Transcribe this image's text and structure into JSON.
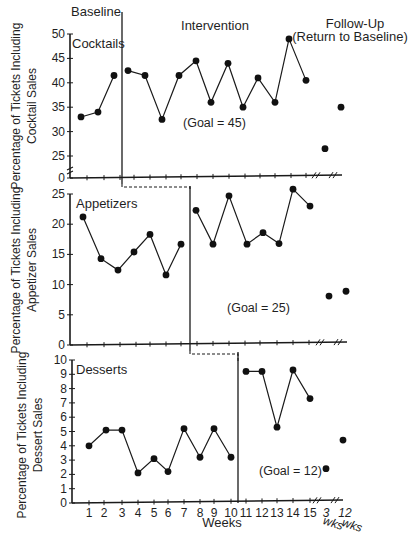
{
  "chart_data": {
    "type": "line",
    "phase_labels": {
      "baseline": "Baseline",
      "intervention": "Intervention",
      "follow_up_line1": "Follow-Up",
      "follow_up_line2": "(Return to Baseline)"
    },
    "xlabel": "Weeks",
    "x_ticks": [
      "1",
      "2",
      "3",
      "4",
      "5",
      "6",
      "7",
      "8",
      "9",
      "10",
      "11",
      "12",
      "13",
      "14",
      "15"
    ],
    "follow_up_ticks": [
      {
        "num": "3",
        "unit": "wks"
      },
      {
        "num": "12",
        "unit": "wks"
      }
    ],
    "panels": [
      {
        "name": "Cocktails",
        "ylabel_line1": "Percentage of Tickets Including",
        "ylabel_line2": "Cocktail Sales",
        "y_ticks": [
          "0",
          "25",
          "30",
          "35",
          "40",
          "45",
          "50"
        ],
        "ylim": [
          0,
          50
        ],
        "axis_break": true,
        "goal_label": "(Goal = 45)",
        "goal": 45,
        "baseline_weeks": [
          1,
          2,
          3
        ],
        "baseline": [
          33,
          34,
          41.5
        ],
        "intervention_weeks": [
          4,
          5,
          6,
          7,
          8,
          9,
          10,
          11,
          12,
          13,
          14,
          15
        ],
        "intervention": [
          42.5,
          41.5,
          32.5,
          41.5,
          44.5,
          36,
          44,
          35,
          41,
          36,
          49,
          40.5
        ],
        "follow_up": {
          "3_wks": 26.5,
          "12_wks": 35
        }
      },
      {
        "name": "Appetizers",
        "ylabel_line1": "Percentage of Tickets Including",
        "ylabel_line2": "Appetizer Sales",
        "y_ticks": [
          "0",
          "5",
          "10",
          "15",
          "20",
          "25"
        ],
        "ylim": [
          0,
          25
        ],
        "goal_label": "(Goal = 25)",
        "goal": 25,
        "baseline_weeks": [
          1,
          2,
          3,
          4,
          5,
          6,
          7
        ],
        "baseline": [
          21.2,
          14.3,
          12.4,
          15.4,
          18.3,
          11.6,
          16.7
        ],
        "intervention_weeks": [
          8,
          9,
          10,
          11,
          12,
          13,
          14,
          15
        ],
        "intervention": [
          22.3,
          16.7,
          24.7,
          16.7,
          18.6,
          16.8,
          25.8,
          23
        ],
        "follow_up": {
          "3_wks": 8.1,
          "12_wks": 8.9
        }
      },
      {
        "name": "Desserts",
        "ylabel_line1": "Percentage of Tickets Including",
        "ylabel_line2": "Dessert Sales",
        "y_ticks": [
          "0",
          "1",
          "2",
          "3",
          "4",
          "5",
          "6",
          "7",
          "8",
          "9",
          "10"
        ],
        "ylim": [
          0,
          10
        ],
        "goal_label": "(Goal = 12)",
        "goal": 12,
        "baseline_weeks": [
          1,
          2,
          3,
          4,
          5,
          6,
          7,
          8,
          9,
          10
        ],
        "baseline": [
          4.0,
          5.1,
          5.1,
          2.1,
          3.1,
          2.2,
          5.2,
          3.2,
          5.2,
          3.2
        ],
        "intervention_weeks": [
          11,
          12,
          13,
          14,
          15
        ],
        "intervention": [
          9.2,
          9.2,
          5.3,
          9.3,
          7.3
        ],
        "follow_up": {
          "3_wks": 2.4,
          "12_wks": 4.4
        }
      }
    ],
    "legend": null,
    "grid": false
  },
  "layout": {
    "panels": [
      {
        "x0": 70,
        "y_top": 34,
        "y_bottom": 178,
        "y_break_top": 156,
        "break_value": 25,
        "axis_top_value": 50,
        "phase_line_x": 122,
        "xs": [
          81,
          98,
          114,
          128,
          145,
          162,
          179,
          196,
          211,
          228,
          243,
          258,
          275,
          289,
          306
        ],
        "follow_xs": [
          325,
          341
        ],
        "axis_end": 342,
        "ticks_x": [
          87,
          104,
          120,
          134,
          150,
          166,
          181,
          197,
          213,
          229,
          245,
          260,
          275,
          291,
          306
        ],
        "goal_pos": [
          183,
          127
        ],
        "label_pos": [
          72,
          38
        ],
        "ylabel_center": [
          20,
          106
        ]
      },
      {
        "x0": 70,
        "y_top": 194,
        "y_bottom": 345,
        "phase_line_x": 190,
        "xs": [
          83,
          101,
          118,
          134,
          150,
          166,
          181,
          196,
          213,
          229,
          247,
          263,
          279,
          293,
          310
        ],
        "follow_xs": [
          329,
          346
        ],
        "axis_end": 347,
        "ticks_x": [
          87,
          104,
          120,
          136,
          150,
          166,
          181,
          197,
          213,
          229,
          245,
          260,
          277,
          293,
          309
        ],
        "goal_pos": [
          227,
          312
        ],
        "label_pos": [
          76,
          198
        ],
        "ylabel_center": [
          20,
          270
        ]
      },
      {
        "x0": 72,
        "y_top": 360,
        "y_bottom": 503,
        "phase_line_x": 238,
        "xs": [
          89,
          106,
          122,
          138,
          154,
          168,
          184,
          200,
          214,
          231,
          246,
          262,
          277,
          293,
          310
        ],
        "follow_xs": [
          326,
          343
        ],
        "axis_end": 343,
        "ticks_x": [
          89,
          104,
          122,
          138,
          154,
          168,
          184,
          200,
          214,
          231,
          246,
          262,
          277,
          293,
          310
        ],
        "goal_pos": [
          259,
          475
        ],
        "label_pos": [
          76,
          364
        ],
        "ylabel_center": [
          26,
          435
        ]
      }
    ]
  }
}
